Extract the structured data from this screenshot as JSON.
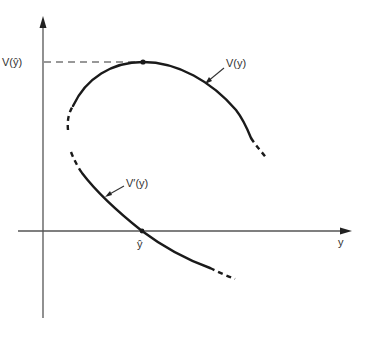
{
  "diagram": {
    "type": "function-and-derivative-sketch",
    "axes": {
      "x_label": "y",
      "y_label": ""
    },
    "labels": {
      "max_value": "V(ŷ)",
      "optimum": "ŷ",
      "function": "V(y)",
      "derivative": "V′(y)"
    },
    "curves": [
      {
        "name": "V(y)",
        "shape": "concave, maximum at ŷ",
        "ends_dashed": true
      },
      {
        "name": "V′(y)",
        "shape": "decreasing, crosses zero at ŷ",
        "ends_dashed": true
      }
    ],
    "colors": {
      "ink": "#1a1a1a",
      "axis": "#555555",
      "background": "#ffffff"
    }
  }
}
